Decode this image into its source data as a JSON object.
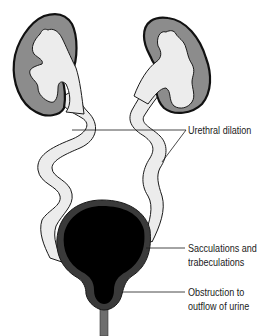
{
  "diagram": {
    "structures": [
      {
        "id": "left-kidney",
        "name": "Kidney (left)"
      },
      {
        "id": "right-kidney",
        "name": "Kidney (right)"
      },
      {
        "id": "left-ureter",
        "name": "Dilated ureter (left)"
      },
      {
        "id": "right-ureter",
        "name": "Dilated ureter (right)"
      },
      {
        "id": "bladder",
        "name": "Bladder"
      },
      {
        "id": "urethra",
        "name": "Urethra"
      }
    ],
    "labels": [
      {
        "id": "urethral-dilation",
        "line1": "Urethral dilation",
        "line2": ""
      },
      {
        "id": "sacculations",
        "line1": "Sacculations and",
        "line2": "trabeculations"
      },
      {
        "id": "obstruction",
        "line1": "Obstruction to",
        "line2": "outflow of urine"
      }
    ],
    "colors": {
      "outline": "#1a1a1a",
      "cortex": "#8c8c8c",
      "pelvis_fill": "#ececec",
      "bladder_lumen": "#000000",
      "bladder_wall": "#3a3a3a",
      "urethra": "#6e6e6e"
    }
  }
}
